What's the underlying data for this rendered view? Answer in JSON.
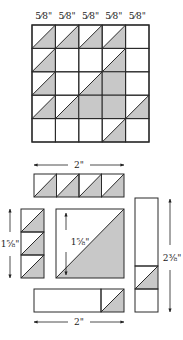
{
  "colors": {
    "shade": "#c8c8c8",
    "line": "#2a2a2a",
    "background": "#ffffff"
  },
  "top_labels": [
    "5⁄8\"",
    "5⁄8\"",
    "5⁄8\"",
    "5⁄8\"",
    "5⁄8\""
  ],
  "grid": {
    "rows": 5,
    "cols": 5,
    "cells_legend": "0=plain, 1=half-square triangle (lower-right shaded), 2=fully shaded",
    "cells": [
      [
        1,
        1,
        1,
        1,
        0
      ],
      [
        1,
        0,
        0,
        1,
        0
      ],
      [
        1,
        0,
        1,
        2,
        0
      ],
      [
        1,
        1,
        2,
        2,
        1
      ],
      [
        0,
        0,
        0,
        1,
        0
      ]
    ]
  },
  "pieces": {
    "top_strip": {
      "width_label": "2\"",
      "units": 4,
      "shaded_units": [
        0,
        1,
        2,
        3
      ]
    },
    "left_strip": {
      "height_label": "1⅝\"",
      "units": 3,
      "shaded_units": [
        0,
        1,
        2
      ]
    },
    "big_square": {
      "height_label": "1⅝\"",
      "type": "half-square triangle"
    },
    "right_strip": {
      "height_label": "2⅜\"",
      "units": 5,
      "shaded_units": [
        3
      ]
    },
    "bottom_strip": {
      "width_label": "2\"",
      "units": 4,
      "shaded_units": [
        3
      ]
    }
  }
}
